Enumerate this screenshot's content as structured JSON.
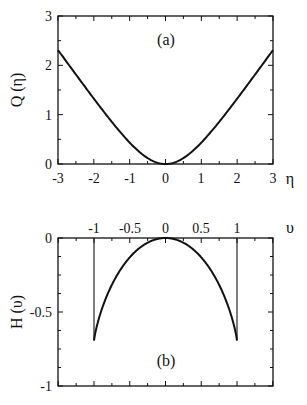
{
  "chart_data": [
    {
      "type": "line",
      "panel_label": "(a)",
      "xlabel": "η",
      "ylabel": "Q (η)",
      "xlim": [
        -3,
        3
      ],
      "ylim": [
        0,
        3
      ],
      "xticks": [
        "-3",
        "-2",
        "-1",
        "0",
        "1",
        "2",
        "3"
      ],
      "yticks": [
        "0",
        "1",
        "2",
        "3"
      ],
      "grid": false,
      "series": [
        {
          "name": "Q(η)",
          "x": [
            -3,
            -2.5,
            -2,
            -1.5,
            -1,
            -0.5,
            0,
            0.5,
            1,
            1.5,
            2,
            2.5,
            3
          ],
          "values": [
            2.31,
            1.82,
            1.33,
            0.86,
            0.43,
            0.12,
            0,
            0.12,
            0.43,
            0.86,
            1.33,
            1.82,
            2.31
          ]
        }
      ]
    },
    {
      "type": "line",
      "panel_label": "(b)",
      "xlabel": "υ",
      "ylabel": "H (υ)",
      "xlim": [
        -1.5,
        1.5
      ],
      "ylim": [
        -1,
        0
      ],
      "xticks": [
        "-1",
        "-0.5",
        "0",
        "0.5",
        "1"
      ],
      "yticks": [
        "0",
        "-0.5",
        "-1"
      ],
      "x_axis_position": "top",
      "grid": false,
      "annotations": [
        "vertical lines at υ = -1 and υ = 1"
      ],
      "series": [
        {
          "name": "H(υ)",
          "x": [
            -1,
            -0.9,
            -0.75,
            -0.5,
            -0.25,
            0,
            0.25,
            0.5,
            0.75,
            0.9,
            1
          ],
          "values": [
            -0.69,
            -0.53,
            -0.39,
            -0.22,
            -0.06,
            0,
            -0.06,
            -0.22,
            -0.39,
            -0.53,
            -0.69
          ]
        }
      ]
    }
  ],
  "panels": {
    "a": {
      "label": "(a)",
      "ylabel": "Q (η)",
      "xlabel": "η",
      "xticks": [
        "-3",
        "-2",
        "-1",
        "0",
        "1",
        "2",
        "3"
      ],
      "yticks": [
        "0",
        "1",
        "2",
        "3"
      ]
    },
    "b": {
      "label": "(b)",
      "ylabel": "H (υ)",
      "xlabel": "υ",
      "xticks": [
        "-1",
        "-0.5",
        "0",
        "0.5",
        "1"
      ],
      "yticks": [
        "0",
        "-0.5",
        "-1"
      ]
    }
  }
}
